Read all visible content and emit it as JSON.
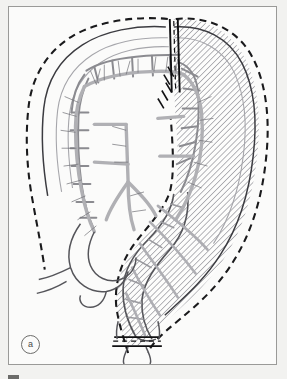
{
  "figure": {
    "panel_label": "a",
    "caption_text": "",
    "background_color": "#f2f2f0",
    "panel_color": "#fbfbfa",
    "border_color": "#9a9a98"
  },
  "legend": {
    "resection_margin_label": "resection margin (dashed)",
    "resected_segment_label": "resected segment (hatched)",
    "vessel_label": "mesenteric vessels",
    "transection_label": "transection / ligature marks"
  },
  "colors": {
    "outline": "#55555a",
    "outline_dark": "#2b2b2e",
    "dashed_margin": "#1a1a1c",
    "hatch": "#9d9da2",
    "vessel": "#b0b0b4",
    "vessel_fine": "#6f6f74",
    "haustra": "#8b8b90",
    "label": "#4a4a48"
  },
  "geometry": {
    "panel": {
      "x": 8,
      "y": 6,
      "width": 269,
      "height": 359
    },
    "hatch_angle_deg": 45,
    "hatch_spacing_px": 3,
    "transection_marks": [
      {
        "name": "transverse-colon-transection",
        "x": 172,
        "y": 18,
        "orientation": "vertical"
      },
      {
        "name": "mesenteric-vessel-ligature",
        "x": 167,
        "y": 72,
        "orientation": "diagonal"
      },
      {
        "name": "rectal-transection",
        "x": 140,
        "y": 338,
        "orientation": "horizontal"
      }
    ]
  }
}
